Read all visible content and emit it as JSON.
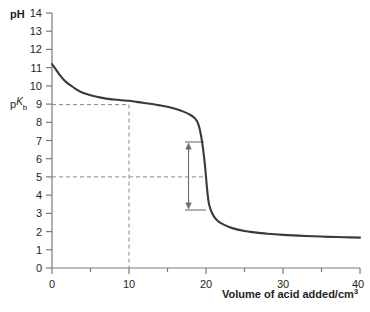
{
  "chart_data": {
    "type": "line",
    "title": "",
    "xlabel": "Volume of acid added/cm",
    "xlabel_sup": "3",
    "ylabel": "pH",
    "xlim": [
      0,
      40
    ],
    "ylim": [
      0,
      14
    ],
    "xticks": [
      0,
      10,
      20,
      30,
      40
    ],
    "xtick_labels": [
      "0",
      "10",
      "20",
      "30",
      "40"
    ],
    "yticks": [
      0,
      1,
      2,
      3,
      4,
      5,
      6,
      7,
      8,
      9,
      10,
      11,
      12,
      13,
      14
    ],
    "ytick_labels": [
      "0",
      "1",
      "2",
      "3",
      "4",
      "5",
      "6",
      "7",
      "8",
      "9",
      "10",
      "11",
      "12",
      "13",
      "14"
    ],
    "grid": false,
    "legend": "none",
    "series": [
      {
        "name": "Titration curve: weak base titrated with strong acid",
        "color": "#3a3a3a",
        "points": [
          [
            0.0,
            11.2
          ],
          [
            0.5,
            10.9
          ],
          [
            1.0,
            10.6
          ],
          [
            1.5,
            10.35
          ],
          [
            2.0,
            10.15
          ],
          [
            2.5,
            10.0
          ],
          [
            3.0,
            9.85
          ],
          [
            3.5,
            9.72
          ],
          [
            4.0,
            9.62
          ],
          [
            5.0,
            9.48
          ],
          [
            6.0,
            9.38
          ],
          [
            7.0,
            9.3
          ],
          [
            8.0,
            9.25
          ],
          [
            9.0,
            9.21
          ],
          [
            10.0,
            9.18
          ],
          [
            11.0,
            9.12
          ],
          [
            12.0,
            9.06
          ],
          [
            13.0,
            9.0
          ],
          [
            14.0,
            8.93
          ],
          [
            15.0,
            8.85
          ],
          [
            16.0,
            8.74
          ],
          [
            17.0,
            8.6
          ],
          [
            18.0,
            8.4
          ],
          [
            18.6,
            8.2
          ],
          [
            19.0,
            7.9
          ],
          [
            19.3,
            7.4
          ],
          [
            19.6,
            6.6
          ],
          [
            19.85,
            5.7
          ],
          [
            20.0,
            5.0
          ],
          [
            20.15,
            4.3
          ],
          [
            20.35,
            3.6
          ],
          [
            20.6,
            3.2
          ],
          [
            21.0,
            2.85
          ],
          [
            21.5,
            2.6
          ],
          [
            22.0,
            2.45
          ],
          [
            23.0,
            2.25
          ],
          [
            24.0,
            2.12
          ],
          [
            25.0,
            2.03
          ],
          [
            26.0,
            1.97
          ],
          [
            28.0,
            1.88
          ],
          [
            30.0,
            1.82
          ],
          [
            32.0,
            1.78
          ],
          [
            34.0,
            1.74
          ],
          [
            36.0,
            1.71
          ],
          [
            38.0,
            1.69
          ],
          [
            40.0,
            1.67
          ]
        ]
      }
    ],
    "annotations": [
      {
        "name": "pkb-horizontal-guide",
        "type": "dashed-horizontal",
        "y": 9.18,
        "x_from": 0,
        "x_to": 10,
        "label": "pK",
        "label_sub": "b"
      },
      {
        "name": "half-equivalence-vertical-guide",
        "type": "dashed-vertical",
        "x": 10,
        "y_from": 0,
        "y_to": 9.18
      },
      {
        "name": "equivalence-horizontal-guide",
        "type": "dashed-horizontal",
        "y": 5.0,
        "x_from": 0,
        "x_to": 20.05
      },
      {
        "name": "ph-range-double-arrow",
        "type": "double-arrow-vertical",
        "x": 17.3,
        "y_top": 7.4,
        "y_bottom": 3.45,
        "cap_x_to": 19.6
      }
    ]
  },
  "labels": {
    "y_axis_title": "pH",
    "x_axis_title": "Volume of acid added/cm",
    "x_axis_title_sup": "3",
    "pkb_main": "p",
    "pkb_k": "K",
    "pkb_sub": "b"
  },
  "colors": {
    "curve": "#3a3a3a",
    "axis": "#7a7a7a",
    "dashed": "#8a8a8a",
    "arrow": "#6e6e6e",
    "text": "#231f20",
    "background": "#ffffff"
  }
}
